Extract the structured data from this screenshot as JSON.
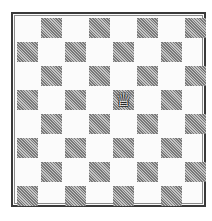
{
  "board": {
    "size": 8,
    "orientation": "white-bottom",
    "light_color": "#fbfbfb",
    "dark_color": "#9a9a9a",
    "border_color": "#3a3a3a",
    "files": [
      "a",
      "b",
      "c",
      "d",
      "e",
      "f",
      "g",
      "h"
    ],
    "ranks": [
      "8",
      "7",
      "6",
      "5",
      "4",
      "3",
      "2",
      "1"
    ]
  },
  "pieces": [
    {
      "square": "e5",
      "type": "queen",
      "color": "white",
      "glyph": "♕",
      "row": 3,
      "col": 4
    }
  ]
}
